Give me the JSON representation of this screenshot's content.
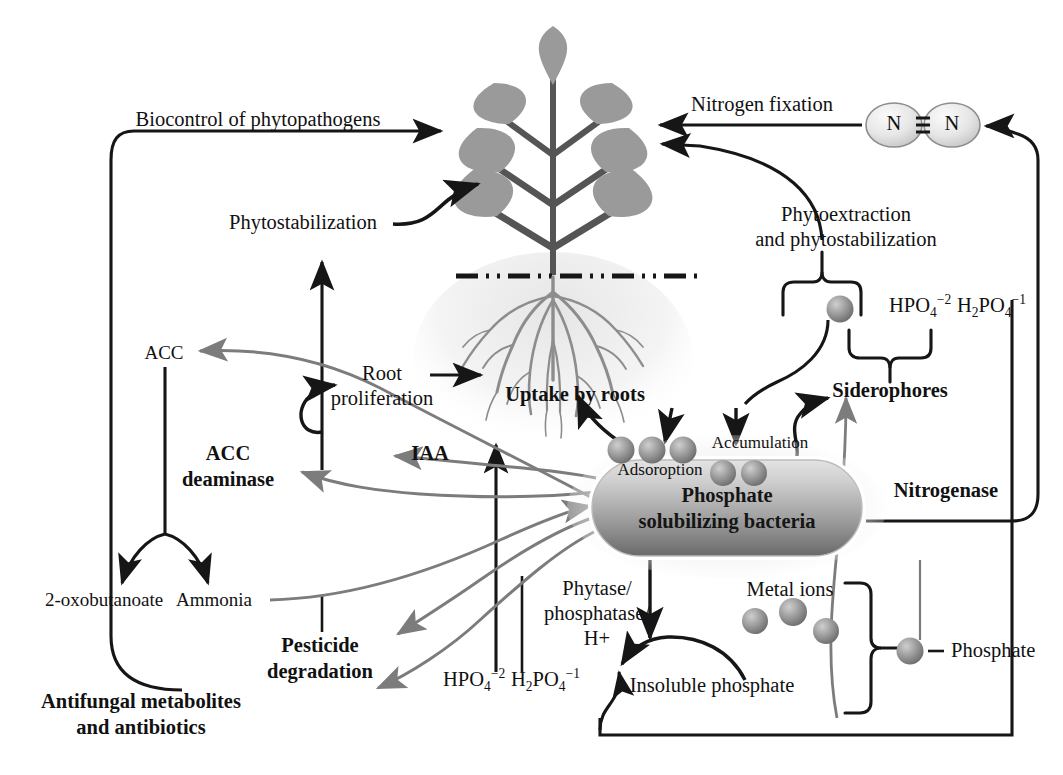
{
  "diagram": {
    "colors": {
      "line_black": "#161616",
      "line_grey": "#7c7c7c",
      "leaf_grey": "#9a9a9a",
      "stem_grey": "#555555",
      "bacteria_top": "#d8d8d8",
      "bacteria_bottom": "#6f6f6f",
      "sphere_grey": "#9b9b9b",
      "soil_halo": "#ebebeb",
      "root_grey": "#8d8d8d",
      "background": "#ffffff"
    }
  },
  "labels": {
    "biocontrol": "Biocontrol of phytopathogens",
    "phytostabilization": "Phytostabilization",
    "nitrogen_fixation": "Nitrogen fixation",
    "phytoextraction_line1": "Phytoextraction",
    "phytoextraction_line2": "and phytostabilization",
    "acc": "ACC",
    "acc_deaminase_line1": "ACC",
    "acc_deaminase_line2": "deaminase",
    "root_prolif_line1": "Root",
    "root_prolif_line2": "proliferation",
    "uptake_by_roots": "Uptake by roots",
    "iaa": "IAA",
    "siderophores": "Siderophores",
    "nitrogenase": "Nitrogenase",
    "adsorption": "Adsoroption",
    "accumulation": "Accumulation",
    "bacteria_line1": "Phosphate",
    "bacteria_line2": "solubilizing bacteria",
    "oxobutanoate": "2-oxobutanoate",
    "ammonia": "Ammonia",
    "pesticide_line1": "Pesticide",
    "pesticide_line2": "degradation",
    "antifungal_line1": "Antifungal metabolites",
    "antifungal_line2": "and antibiotics",
    "phytase_line1": "Phytase/",
    "phytase_line2": "phosphatase/",
    "phytase_line3": "H+",
    "insoluble_phosphate": "Insoluble phosphate",
    "metal_ions": "Metal ions",
    "phosphate": "Phosphate",
    "nitrogen_atom": "N"
  },
  "formulas": {
    "hpo4": {
      "head": "HPO",
      "sub": "4",
      "sup": "−2"
    },
    "h2po4": {
      "head": "H",
      "sub1": "2",
      "mid": "PO",
      "sub2": "4",
      "sup": "−1"
    }
  },
  "icon_names": [
    "plant-icon",
    "root-system-icon",
    "soil-line-icon",
    "bacteria-capsule-icon",
    "nitrogen-molecule-icon",
    "phosphate-sphere-icon",
    "metal-ion-sphere-icon",
    "arrow-icon",
    "brace-icon"
  ]
}
